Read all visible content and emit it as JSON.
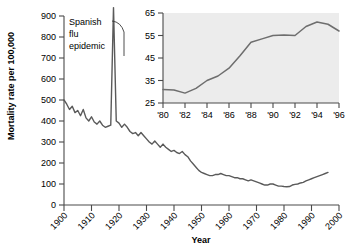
{
  "chart_data": [
    {
      "type": "line",
      "id": "main",
      "title": "",
      "xlabel": "Year",
      "ylabel": "Mortality rate per 100,000",
      "xlim": [
        1900,
        2000
      ],
      "ylim": [
        0,
        900
      ],
      "yticks": [
        0,
        100,
        200,
        300,
        400,
        500,
        600,
        700,
        800,
        900
      ],
      "xticks": [
        1900,
        1910,
        1920,
        1930,
        1940,
        1950,
        1960,
        1970,
        1980,
        1990,
        2000
      ],
      "xtick_labels": [
        "1900",
        "1910",
        "1920",
        "1930",
        "1940",
        "1950",
        "1960",
        "1970",
        "1980",
        "1990",
        "2000"
      ],
      "ytick_labels": [
        "0",
        "100",
        "200",
        "300",
        "400",
        "500",
        "600",
        "700",
        "800",
        "900"
      ],
      "grid": false,
      "legend": "none",
      "line_color": "#5a5a5a",
      "annotations": [
        {
          "text": "Spanish\nflu\nepidemic",
          "x": 1901,
          "y": 870,
          "pointer_to_x": 1918,
          "pointer_to_y": 880
        }
      ],
      "x": [
        1900,
        1901,
        1902,
        1903,
        1904,
        1905,
        1906,
        1907,
        1908,
        1909,
        1910,
        1911,
        1912,
        1913,
        1914,
        1915,
        1916,
        1917,
        1918,
        1919,
        1920,
        1921,
        1922,
        1923,
        1924,
        1925,
        1926,
        1927,
        1928,
        1929,
        1930,
        1931,
        1932,
        1933,
        1934,
        1935,
        1936,
        1937,
        1938,
        1939,
        1940,
        1941,
        1942,
        1943,
        1944,
        1945,
        1946,
        1947,
        1948,
        1949,
        1950,
        1951,
        1952,
        1953,
        1954,
        1955,
        1956,
        1957,
        1958,
        1959,
        1960,
        1961,
        1962,
        1963,
        1964,
        1965,
        1966,
        1967,
        1968,
        1969,
        1970,
        1971,
        1972,
        1973,
        1974,
        1975,
        1976,
        1977,
        1978,
        1979,
        1980,
        1981,
        1982,
        1983,
        1984,
        1985,
        1986,
        1987,
        1988,
        1989,
        1990,
        1991,
        1992,
        1993,
        1994,
        1995,
        1996
      ],
      "values": [
        500,
        480,
        455,
        470,
        440,
        450,
        425,
        455,
        415,
        400,
        420,
        395,
        385,
        400,
        380,
        370,
        375,
        380,
        940,
        400,
        390,
        370,
        385,
        370,
        350,
        340,
        345,
        330,
        345,
        330,
        315,
        300,
        290,
        305,
        290,
        275,
        290,
        275,
        265,
        255,
        260,
        250,
        245,
        255,
        240,
        230,
        210,
        195,
        180,
        165,
        155,
        150,
        145,
        140,
        140,
        145,
        145,
        150,
        145,
        140,
        140,
        135,
        130,
        130,
        125,
        125,
        120,
        115,
        120,
        115,
        110,
        105,
        100,
        95,
        95,
        100,
        100,
        95,
        90,
        90,
        88,
        87,
        88,
        95,
        98,
        100,
        105,
        108,
        115,
        120,
        125,
        130,
        135,
        140,
        145,
        150,
        155
      ]
    },
    {
      "type": "line",
      "id": "inset",
      "title": "",
      "xlabel": "",
      "ylabel": "",
      "xlim": [
        1980,
        1996
      ],
      "ylim": [
        25,
        65
      ],
      "yticks": [
        25,
        35,
        45,
        55,
        65
      ],
      "ytick_labels": [
        "25",
        "35",
        "45",
        "55",
        "65"
      ],
      "xticks": [
        1980,
        1982,
        1984,
        1986,
        1988,
        1990,
        1992,
        1994,
        1996
      ],
      "xtick_labels": [
        "'80",
        "'82",
        "'84",
        "'86",
        "'88",
        "'90",
        "'92",
        "'94",
        "'96"
      ],
      "grid": false,
      "legend": "none",
      "line_color": "#6e6e6e",
      "panel_color": "#ececec",
      "x": [
        1980,
        1981,
        1982,
        1983,
        1984,
        1985,
        1986,
        1987,
        1988,
        1989,
        1990,
        1991,
        1992,
        1993,
        1994,
        1995,
        1996
      ],
      "values": [
        31.0,
        30.8,
        29.4,
        31.5,
        35.0,
        37.0,
        40.5,
        46.0,
        52.0,
        53.5,
        55.0,
        55.2,
        55.0,
        59.0,
        61.0,
        60.0,
        57.0
      ]
    }
  ],
  "main_chart": {
    "ylabel": "Mortality rate per 100,000",
    "xlabel": "Year",
    "annotation_lines": [
      "Spanish",
      "flu",
      "epidemic"
    ]
  }
}
